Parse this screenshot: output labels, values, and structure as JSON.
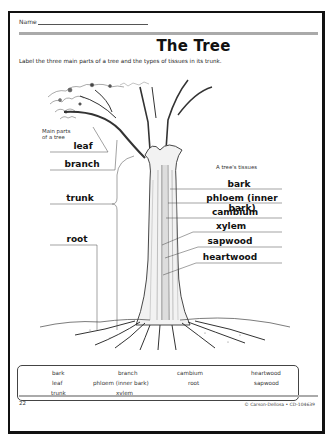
{
  "worksheet": {
    "name_label": "Name",
    "title": "The Tree",
    "instructions": "Label the three main parts of a tree and the types of tissues in its trunk.",
    "main_parts_caption": "Main parts of a tree",
    "main_parts_caption_line1": "Main parts",
    "main_parts_caption_line2": "of a tree",
    "main_parts": [
      {
        "label": "leaf"
      },
      {
        "label": "branch"
      },
      {
        "label": "trunk"
      },
      {
        "label": "root"
      }
    ],
    "tissues_caption": "A tree's tissues",
    "tissues": [
      {
        "label": "bark"
      },
      {
        "label": "phloem (inner bark)"
      },
      {
        "label": "cambium"
      },
      {
        "label": "xylem"
      },
      {
        "label": "sapwood"
      },
      {
        "label": "heartwood"
      }
    ],
    "word_bank": {
      "columns": [
        [
          "bark",
          "leaf",
          "trunk"
        ],
        [
          "branch",
          "phloem (inner bark)",
          "xylem"
        ],
        [
          "cambium",
          "root"
        ],
        [
          "heartwood",
          "sapwood"
        ]
      ]
    },
    "footer": {
      "page_number": "22",
      "copyright": "© Carson-Dellosa • CD-104639"
    }
  }
}
